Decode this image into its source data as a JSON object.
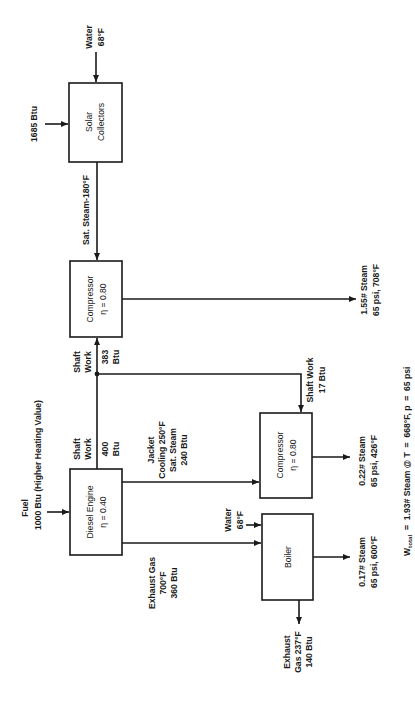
{
  "diagram": {
    "orientation": "rotated-90-ccw",
    "nodes": {
      "solar_collectors": {
        "line1": "Solar",
        "line2": "Collectors"
      },
      "compressor_main": {
        "line1": "Compressor",
        "line2": "η = 0.80"
      },
      "diesel_engine": {
        "line1": "Diesel Engine",
        "line2": "η = 0.40"
      },
      "compressor_secondary": {
        "line1": "Compressor",
        "line2": "η = 0.80"
      },
      "boiler": {
        "line1": "Boiler"
      }
    },
    "labels": {
      "water_in_solar": {
        "line1": "Water",
        "line2": "68°F"
      },
      "solar_input": "1685 Btu",
      "sat_steam": "Sat. Steam-180°F",
      "shaft_work_383": {
        "line1": "Shaft",
        "line2": "Work",
        "line3": "383",
        "line4": "Btu"
      },
      "shaft_work_400": {
        "line1": "Shaft",
        "line2": "Work",
        "line3": "400",
        "line4": "Btu"
      },
      "fuel": {
        "line1": "Fuel",
        "line2": "1000 Btu (Higher Heating Value)"
      },
      "jacket_cooling": {
        "line1": "Jacket",
        "line2": "Cooling 250°F",
        "line3": "Sat. Steam",
        "line4": "240 Btu"
      },
      "exhaust_gas_in": {
        "line1": "Exhaust Gas",
        "line2": "700°F",
        "line3": "360 Btu"
      },
      "water_in_boiler": {
        "line1": "Water",
        "line2": "68°F"
      },
      "exhaust_out": {
        "line1": "Exhaust",
        "line2": "Gas 237°F",
        "line3": "140 Btu"
      },
      "shaft_work_17": {
        "line1": "Shaft Work",
        "line2": "17 Btu"
      },
      "steam_out_main": {
        "line1": "1.55# Steam",
        "line2": "65 psi, 708°F"
      },
      "steam_out_secondary": {
        "line1": "0.22# Steam",
        "line2": "65 psi, 426°F"
      },
      "steam_out_boiler": {
        "line1": "0.17# Steam",
        "line2": "65 psi, 600°F"
      },
      "total": {
        "w": "W",
        "sub": "total",
        "rest": "  =  1.93# Steam @ T  =  668°F, p  =  65 psi"
      }
    }
  }
}
